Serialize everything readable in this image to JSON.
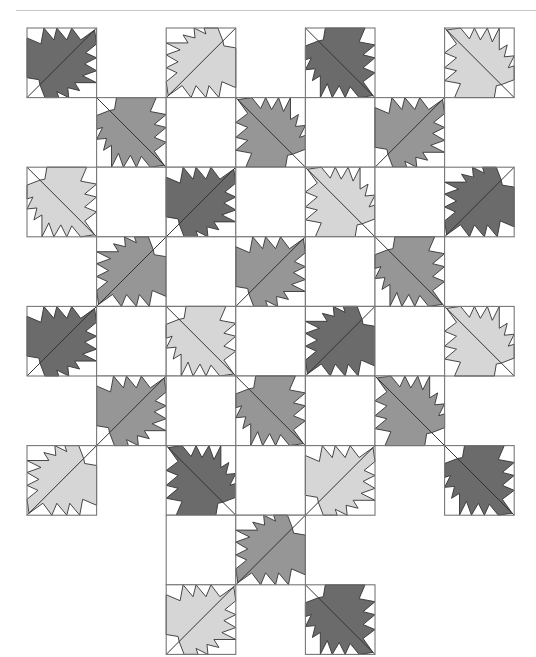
{
  "diagram": {
    "type": "quilt-layout",
    "block": "maple-leaf",
    "grid": {
      "rows": 9,
      "cols": 7,
      "origin_x": 27,
      "origin_y": 28,
      "cell": 69.6
    },
    "colors": {
      "dark": "#6b6b6b",
      "medium": "#969696",
      "light": "#d6d6d6",
      "background": "#ffffff",
      "outline": "#333333",
      "border": "#777777"
    },
    "blocks": [
      {
        "r": 0,
        "c": 0,
        "kind": "leaf",
        "shade": "dark",
        "stem": "BL"
      },
      {
        "r": 0,
        "c": 1,
        "kind": "none"
      },
      {
        "r": 0,
        "c": 2,
        "kind": "leaf",
        "shade": "light",
        "stem": "TR"
      },
      {
        "r": 0,
        "c": 3,
        "kind": "none"
      },
      {
        "r": 0,
        "c": 4,
        "kind": "leaf",
        "shade": "dark",
        "stem": "TL"
      },
      {
        "r": 0,
        "c": 5,
        "kind": "none"
      },
      {
        "r": 0,
        "c": 6,
        "kind": "leaf",
        "shade": "light",
        "stem": "BR"
      },
      {
        "r": 1,
        "c": 1,
        "kind": "leaf",
        "shade": "medium",
        "stem": "TL"
      },
      {
        "r": 1,
        "c": 2,
        "kind": "white"
      },
      {
        "r": 1,
        "c": 3,
        "kind": "leaf",
        "shade": "medium",
        "stem": "BR"
      },
      {
        "r": 1,
        "c": 4,
        "kind": "white"
      },
      {
        "r": 1,
        "c": 5,
        "kind": "leaf",
        "shade": "medium",
        "stem": "BL"
      },
      {
        "r": 2,
        "c": 0,
        "kind": "leaf",
        "shade": "light",
        "stem": "TL"
      },
      {
        "r": 2,
        "c": 1,
        "kind": "white"
      },
      {
        "r": 2,
        "c": 2,
        "kind": "leaf",
        "shade": "dark",
        "stem": "BL"
      },
      {
        "r": 2,
        "c": 3,
        "kind": "white"
      },
      {
        "r": 2,
        "c": 4,
        "kind": "leaf",
        "shade": "light",
        "stem": "BR"
      },
      {
        "r": 2,
        "c": 5,
        "kind": "white"
      },
      {
        "r": 2,
        "c": 6,
        "kind": "leaf",
        "shade": "dark",
        "stem": "TR"
      },
      {
        "r": 3,
        "c": 1,
        "kind": "leaf",
        "shade": "medium",
        "stem": "TR"
      },
      {
        "r": 3,
        "c": 2,
        "kind": "white"
      },
      {
        "r": 3,
        "c": 3,
        "kind": "leaf",
        "shade": "medium",
        "stem": "BL"
      },
      {
        "r": 3,
        "c": 4,
        "kind": "white"
      },
      {
        "r": 3,
        "c": 5,
        "kind": "leaf",
        "shade": "medium",
        "stem": "TL"
      },
      {
        "r": 4,
        "c": 0,
        "kind": "leaf",
        "shade": "dark",
        "stem": "BL"
      },
      {
        "r": 4,
        "c": 1,
        "kind": "white"
      },
      {
        "r": 4,
        "c": 2,
        "kind": "leaf",
        "shade": "light",
        "stem": "TL"
      },
      {
        "r": 4,
        "c": 3,
        "kind": "white"
      },
      {
        "r": 4,
        "c": 4,
        "kind": "leaf",
        "shade": "dark",
        "stem": "TR"
      },
      {
        "r": 4,
        "c": 5,
        "kind": "white"
      },
      {
        "r": 4,
        "c": 6,
        "kind": "leaf",
        "shade": "light",
        "stem": "BR"
      },
      {
        "r": 5,
        "c": 1,
        "kind": "leaf",
        "shade": "medium",
        "stem": "BL"
      },
      {
        "r": 5,
        "c": 2,
        "kind": "white"
      },
      {
        "r": 5,
        "c": 3,
        "kind": "leaf",
        "shade": "medium",
        "stem": "TL"
      },
      {
        "r": 5,
        "c": 4,
        "kind": "white"
      },
      {
        "r": 5,
        "c": 5,
        "kind": "leaf",
        "shade": "medium",
        "stem": "BR"
      },
      {
        "r": 6,
        "c": 0,
        "kind": "leaf",
        "shade": "light",
        "stem": "TR"
      },
      {
        "r": 6,
        "c": 2,
        "kind": "leaf",
        "shade": "dark",
        "stem": "BR"
      },
      {
        "r": 6,
        "c": 3,
        "kind": "white"
      },
      {
        "r": 6,
        "c": 4,
        "kind": "leaf",
        "shade": "light",
        "stem": "BL"
      },
      {
        "r": 6,
        "c": 6,
        "kind": "leaf",
        "shade": "dark",
        "stem": "TL"
      },
      {
        "r": 7,
        "c": 2,
        "kind": "white"
      },
      {
        "r": 7,
        "c": 3,
        "kind": "leaf",
        "shade": "medium",
        "stem": "TR"
      },
      {
        "r": 8,
        "c": 2,
        "kind": "leaf",
        "shade": "light",
        "stem": "BL"
      },
      {
        "r": 8,
        "c": 4,
        "kind": "leaf",
        "shade": "dark",
        "stem": "TL"
      }
    ]
  }
}
